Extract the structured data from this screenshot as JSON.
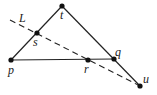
{
  "diagram": {
    "points": {
      "t": {
        "label": "t",
        "x": 62,
        "y": 6
      },
      "s": {
        "label": "s",
        "x": 37,
        "y": 33
      },
      "p": {
        "label": "p",
        "x": 11,
        "y": 60
      },
      "r": {
        "label": "r",
        "x": 88,
        "y": 60
      },
      "q": {
        "label": "q",
        "x": 114,
        "y": 59
      },
      "u": {
        "label": "u",
        "x": 140,
        "y": 86
      }
    },
    "line_label": "L",
    "segments": [
      {
        "from": "p",
        "to": "t",
        "style": "solid"
      },
      {
        "from": "t",
        "to": "u",
        "style": "solid"
      },
      {
        "from": "p",
        "to": "q",
        "style": "solid"
      },
      {
        "from": "L_start",
        "to": "u",
        "style": "dashed"
      }
    ],
    "colors": {
      "stroke": "#222222",
      "dot": "#111111",
      "background": "#ffffff"
    }
  }
}
